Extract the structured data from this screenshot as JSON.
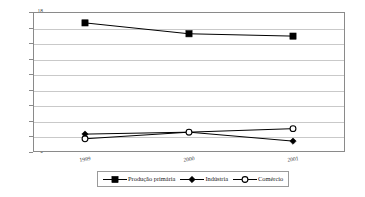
{
  "chart_data": {
    "type": "line",
    "title": "",
    "xlabel": "",
    "ylabel": "Milhões de Reais (R$)",
    "categories": [
      "1999",
      "2000",
      "2001"
    ],
    "ylim": [
      0,
      18
    ],
    "yticks": [
      0,
      2,
      4,
      6,
      8,
      10,
      12,
      14,
      16,
      18
    ],
    "ytick_labels": [
      "0",
      "2",
      "4",
      "6",
      "8",
      "10",
      "12",
      "14",
      "16",
      "18"
    ],
    "grid": true,
    "legend_position": "bottom",
    "series": [
      {
        "name": "Produção primária",
        "marker": "filled-square",
        "color": "#000000",
        "values": [
          16.6,
          15.2,
          14.9
        ]
      },
      {
        "name": "Indústria",
        "marker": "filled-diamond",
        "color": "#000000",
        "values": [
          2.3,
          2.55,
          1.4
        ]
      },
      {
        "name": "Comércio",
        "marker": "open-circle",
        "color": "#000000",
        "values": [
          1.7,
          2.55,
          3.0
        ]
      }
    ]
  },
  "axis": {
    "y_title": "Milhões de Reais (R$)",
    "y_labels": [
      "18",
      "16",
      "14",
      "12",
      "10",
      "8",
      "6",
      "4",
      "2",
      "0"
    ],
    "x_labels": [
      "1999",
      "2000",
      "2001"
    ]
  },
  "legend": {
    "items": [
      {
        "label": "Produção primária",
        "marker": "filled-square"
      },
      {
        "label": "Indústria",
        "marker": "filled-diamond"
      },
      {
        "label": "Comércio",
        "marker": "open-circle"
      }
    ]
  },
  "colors": {
    "line": "#000000",
    "grid": "#c9c9c9",
    "frame": "#8a8a8a",
    "background": "#ffffff"
  }
}
